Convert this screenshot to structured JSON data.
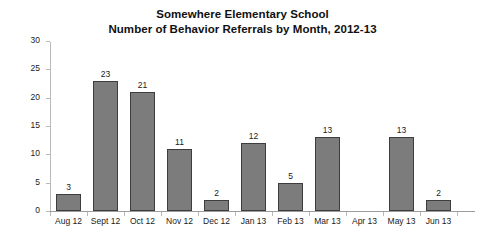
{
  "chart_data": {
    "type": "bar",
    "title": "Somewhere Elementary School",
    "subtitle": "Number of Behavior Referrals by Month, 2012-13",
    "xlabel": "",
    "ylabel": "Number of Referrals",
    "categories": [
      "Aug 12",
      "Sept 12",
      "Oct 12",
      "Nov 12",
      "Dec 12",
      "Jan 13",
      "Feb 13",
      "Mar 13",
      "Apr 13",
      "May 13",
      "Jun 13"
    ],
    "values": [
      3,
      23,
      21,
      11,
      2,
      12,
      5,
      13,
      0,
      13,
      2
    ],
    "value_labels": [
      "3",
      "23",
      "21",
      "11",
      "2",
      "12",
      "5",
      "13",
      "",
      "13",
      "2"
    ],
    "ylim": [
      0,
      30
    ],
    "ytick_labels": [
      "0",
      "5",
      "10",
      "15",
      "20",
      "25",
      "30"
    ],
    "ytick_values": [
      0,
      5,
      10,
      15,
      20,
      25,
      30
    ],
    "grid": false,
    "legend": "none",
    "bar_color": "#7c7c7c",
    "bar_border_color": "#3d3d3d",
    "axis_color": "#b9b9b9",
    "text_color": "#1a1a1a",
    "background_color": "#ffffff"
  }
}
